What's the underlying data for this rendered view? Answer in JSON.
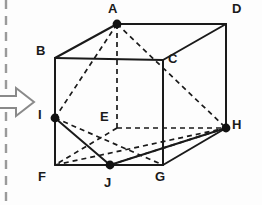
{
  "figure": {
    "title_visible": false,
    "type": "geometry-diagram",
    "background_color": "#fdfdfd",
    "line_color": "#1a1a1a",
    "vertex_dot_color": "#111111",
    "label_color": "#1a1a1a"
  },
  "margin_marks": {
    "fold_line": {
      "name": "dashed-fold-line",
      "orientation": "vertical",
      "x": 6,
      "y1": 0,
      "y2": 205,
      "color": "#9a9a9a",
      "dash": "9 7"
    },
    "arrow": {
      "name": "right-arrow-marker",
      "direction": "right",
      "color": "#8a8a8a",
      "points": "-14,96 16,96 16,88 34,102 16,116 16,108 -14,108"
    }
  },
  "points": [
    {
      "id": "A",
      "x": 117,
      "y": 24,
      "dot": true,
      "label_x": 108,
      "label_y": 2
    },
    {
      "id": "D",
      "x": 226,
      "y": 24,
      "dot": false,
      "label_x": 232,
      "label_y": 2
    },
    {
      "id": "B",
      "x": 55,
      "y": 58,
      "dot": false,
      "label_x": 36,
      "label_y": 44
    },
    {
      "id": "C",
      "x": 163,
      "y": 60,
      "dot": false,
      "label_x": 168,
      "label_y": 52
    },
    {
      "id": "I",
      "x": 55,
      "y": 118,
      "dot": true,
      "label_x": 38,
      "label_y": 108
    },
    {
      "id": "E",
      "x": 117,
      "y": 128,
      "dot": false,
      "label_x": 100,
      "label_y": 110
    },
    {
      "id": "H",
      "x": 226,
      "y": 128,
      "dot": true,
      "label_x": 232,
      "label_y": 118
    },
    {
      "id": "F",
      "x": 55,
      "y": 165,
      "dot": false,
      "label_x": 38,
      "label_y": 170
    },
    {
      "id": "J",
      "x": 110,
      "y": 165,
      "dot": true,
      "label_x": 104,
      "label_y": 176
    },
    {
      "id": "G",
      "x": 163,
      "y": 165,
      "dot": false,
      "label_x": 155,
      "label_y": 170
    }
  ],
  "edges_solid": [
    {
      "name": "edge-A-B",
      "from": "A",
      "to": "B"
    },
    {
      "name": "edge-A-D",
      "from": "A",
      "to": "D"
    },
    {
      "name": "edge-B-C",
      "from": "B",
      "to": "C"
    },
    {
      "name": "edge-C-D",
      "from": "C",
      "to": "D"
    },
    {
      "name": "edge-D-H",
      "from": "D",
      "to": "H"
    },
    {
      "name": "edge-B-F",
      "from": "B",
      "to": "F"
    },
    {
      "name": "edge-F-G",
      "from": "F",
      "to": "G"
    },
    {
      "name": "edge-C-G",
      "from": "C",
      "to": "G"
    },
    {
      "name": "edge-G-H",
      "from": "G",
      "to": "H"
    },
    {
      "name": "cut-I-J",
      "from": "I",
      "to": "J"
    },
    {
      "name": "cut-J-H",
      "from": "J",
      "to": "H"
    }
  ],
  "edges_dashed": [
    {
      "name": "hidden-edge-A-E",
      "from": "A",
      "to": "E"
    },
    {
      "name": "hidden-edge-E-F",
      "from": "E",
      "to": "F"
    },
    {
      "name": "hidden-edge-E-H",
      "from": "E",
      "to": "H"
    },
    {
      "name": "cut-A-I",
      "from": "A",
      "to": "I"
    },
    {
      "name": "cut-A-H",
      "from": "A",
      "to": "H"
    },
    {
      "name": "cut-I-F-diag",
      "from": "I",
      "to": "G"
    },
    {
      "name": "cut-J-E",
      "from": "J",
      "to": "H"
    },
    {
      "name": "cut-F-J-upper",
      "from": "F",
      "to": "H"
    }
  ],
  "labels": {
    "A": "A",
    "B": "B",
    "C": "C",
    "D": "D",
    "E": "E",
    "F": "F",
    "G": "G",
    "H": "H",
    "I": "I",
    "J": "J"
  },
  "geometry_notes": {
    "solid": "cube",
    "front_face": "B-C-G-F",
    "back_face": "A-D-H-E",
    "I_is": "point on edge BF",
    "J_is": "point on edge FG",
    "cross_section": "A-I-J-H"
  }
}
